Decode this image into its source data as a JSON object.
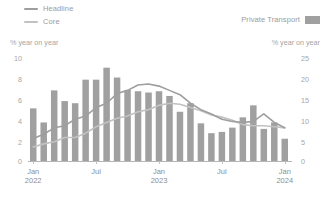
{
  "legend": {
    "left_items": [
      {
        "label": "Headline",
        "marker": "line",
        "color": "#9e9e9e"
      },
      {
        "label": "Core",
        "marker": "line",
        "color": "#bdbdbd"
      }
    ],
    "right_items": [
      {
        "label": "Private Transport",
        "marker": "swatch",
        "color": "#a0a0a0"
      }
    ]
  },
  "axis_units": {
    "left": "% year on year",
    "right": "% year on year"
  },
  "chart_data": {
    "type": "bar",
    "title": "",
    "subtitle": "",
    "xlabel": "",
    "ylabel": "% year on year",
    "y2label": "% year on year",
    "grid": false,
    "legend_position": "top",
    "ylim": [
      0,
      10
    ],
    "y2lim": [
      0,
      25
    ],
    "yticks": [
      "0",
      "2",
      "4",
      "6",
      "8",
      "10"
    ],
    "y2ticks": [
      "0",
      "5",
      "10",
      "15",
      "20",
      "25"
    ],
    "x": [
      "Jan 2022",
      "Feb 2022",
      "Mar 2022",
      "Apr 2022",
      "May 2022",
      "Jun 2022",
      "Jul 2022",
      "Aug 2022",
      "Sep 2022",
      "Oct 2022",
      "Nov 2022",
      "Dec 2022",
      "Jan 2023",
      "Feb 2023",
      "Mar 2023",
      "Apr 2023",
      "May 2023",
      "Jun 2023",
      "Jul 2023",
      "Aug 2023",
      "Sep 2023",
      "Oct 2023",
      "Nov 2023",
      "Dec 2023",
      "Jan 2024"
    ],
    "xtick_labels": [
      {
        "line1": "Jan",
        "line2": "2022",
        "index": 0
      },
      {
        "line1": "Jul",
        "line2": "",
        "index": 6
      },
      {
        "line1": "Jan",
        "line2": "2023",
        "index": 12
      },
      {
        "line1": "Jul",
        "line2": "",
        "index": 18
      },
      {
        "line1": "Jan",
        "line2": "2024",
        "index": 24
      }
    ],
    "series": [
      {
        "name": "Private Transport",
        "type": "bar",
        "axis": "right",
        "color": "#a0a0a0",
        "values": [
          12.3,
          9.0,
          16.5,
          14.0,
          13.5,
          19.0,
          19.0,
          21.8,
          19.5,
          16.6,
          16.3,
          16.0,
          16.3,
          15.2,
          11.5,
          13.5,
          8.8,
          6.5,
          6.8,
          7.8,
          10.2,
          13.0,
          7.5,
          9.0,
          5.2
        ]
      },
      {
        "name": "Headline",
        "type": "line",
        "axis": "left",
        "color": "#9e9e9e",
        "values": [
          2.1,
          2.5,
          3.1,
          3.3,
          3.9,
          4.2,
          5.0,
          5.4,
          6.3,
          6.6,
          7.1,
          7.2,
          7.0,
          6.6,
          6.2,
          5.4,
          4.8,
          4.4,
          3.9,
          3.7,
          3.6,
          3.7,
          4.4,
          3.6,
          3.1
        ]
      },
      {
        "name": "Core",
        "type": "line",
        "axis": "left",
        "color": "#c2c2c2",
        "values": [
          1.3,
          1.6,
          1.8,
          2.2,
          2.2,
          2.6,
          3.2,
          3.6,
          4.0,
          4.2,
          4.6,
          4.8,
          5.2,
          5.4,
          5.3,
          5.0,
          4.7,
          4.3,
          4.1,
          3.8,
          3.4,
          3.3,
          3.3,
          3.2,
          3.1
        ]
      }
    ]
  }
}
